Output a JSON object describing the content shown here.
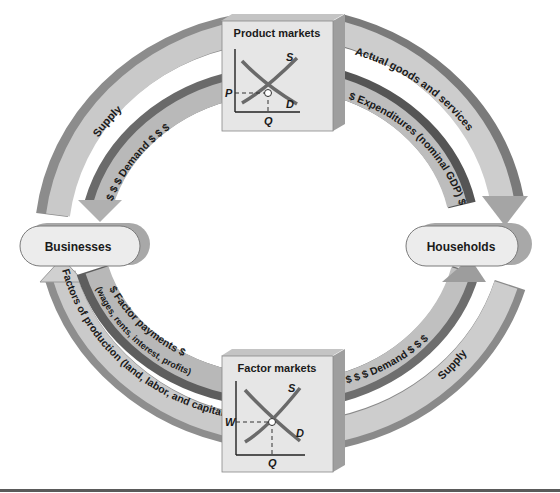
{
  "diagram": {
    "type": "circular-flow",
    "nodes": {
      "businesses": "Businesses",
      "households": "Households"
    },
    "markets": {
      "product": {
        "title": "Product markets",
        "supply_label": "S",
        "demand_label": "D",
        "price_label": "P",
        "quantity_label": "Q"
      },
      "factor": {
        "title": "Factor markets",
        "supply_label": "S",
        "demand_label": "D",
        "price_label": "W",
        "quantity_label": "Q"
      }
    },
    "flows": {
      "outer_top_left": "Supply",
      "outer_top_right": "Actual goods and services",
      "inner_top_left": "$ $ $ Demand $ $ $",
      "inner_top_right": "$ Expenditures (nominal GDP) $",
      "outer_bottom_left": "Factors of production (land, labor, and capital)",
      "inner_bottom_left_main": "$ Factor payments $",
      "inner_bottom_left_sub": "(wages, rents, interest, profits)",
      "inner_bottom_right": "$ $ $ Demand $ $ $",
      "outer_bottom_right": "Supply"
    },
    "colors": {
      "band_light": "#c8c8c8",
      "band_mid": "#a9a9a9",
      "band_dark": "#6e6e6e",
      "box_face": "#e6e6e6",
      "box_side": "#bdbdbd",
      "curve": "#6a6a6a",
      "rule": "#555555"
    }
  }
}
